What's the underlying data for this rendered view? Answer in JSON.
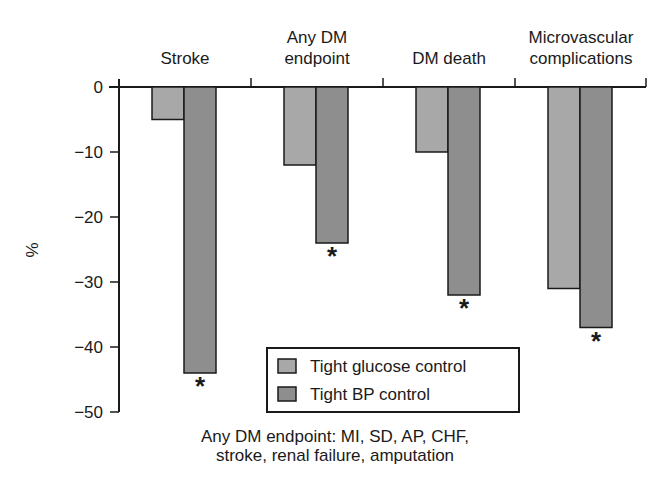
{
  "chart_data": {
    "type": "bar",
    "title": "",
    "xlabel": "",
    "ylabel": "%",
    "ylim": [
      -50,
      0
    ],
    "yticks": [
      0,
      -10,
      -20,
      -30,
      -40,
      -50
    ],
    "ytick_labels": [
      "0",
      "−10",
      "−20",
      "−30",
      "−40",
      "−50"
    ],
    "grid": false,
    "legend_position": "lower center (inside plot)",
    "categories": [
      "Stroke",
      "Any DM endpoint",
      "DM death",
      "Microvascular complications"
    ],
    "category_label_lines": [
      [
        "Stroke"
      ],
      [
        "Any DM",
        "endpoint"
      ],
      [
        "DM death"
      ],
      [
        "Microvascular",
        "complications"
      ]
    ],
    "series": [
      {
        "name": "Tight glucose control",
        "color": "#a8a8a8",
        "values": [
          -5,
          -12,
          -10,
          -31
        ]
      },
      {
        "name": "Tight BP control",
        "color": "#8e8e8e",
        "values": [
          -44,
          -24,
          -32,
          -37
        ]
      }
    ],
    "significance_markers": [
      {
        "category": "Stroke",
        "series": "Tight BP control",
        "symbol": "*"
      },
      {
        "category": "Any DM endpoint",
        "series": "Tight BP control",
        "symbol": "*"
      },
      {
        "category": "DM death",
        "series": "Tight BP control",
        "symbol": "*"
      },
      {
        "category": "Microvascular complications",
        "series": "Tight BP control",
        "symbol": "*"
      }
    ],
    "annotations": [
      "Any DM endpoint: MI, SD, AP, CHF,",
      "stroke, renal failure, amputation"
    ]
  },
  "footnote": {
    "line1": "Any DM endpoint: MI, SD, AP, CHF,",
    "line2": "stroke, renal failure, amputation"
  },
  "legend": {
    "items": [
      {
        "label": "Tight glucose control"
      },
      {
        "label": "Tight BP control"
      }
    ]
  },
  "axis": {
    "y_label": "%"
  }
}
